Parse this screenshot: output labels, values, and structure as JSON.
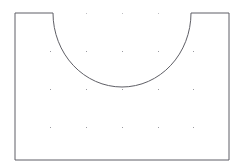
{
  "figure": {
    "background_color": "#ffffff",
    "outline_color": "#5f5f66",
    "outline_width": 1,
    "dot_color": "#8a8a90",
    "fill_color": "#ffffff"
  },
  "shape": {
    "name": "rectangle-with-semicircular-notch",
    "rect": {
      "left": 15,
      "top": 13,
      "right": 229,
      "bottom": 160,
      "width": 214,
      "height": 147
    },
    "notch": {
      "type": "semicircle",
      "center_x": 122,
      "center_y": 13,
      "radius": 69,
      "left_x": 53,
      "right_x": 191,
      "bottom_y": 87,
      "opens": "up"
    },
    "path": "M 15 13 L 53 13 A 69 74 0 0 0 191 13 L 229 13 L 229 160 L 15 160 Z"
  },
  "grid": {
    "columns_x": [
      50,
      86,
      122,
      158,
      193
    ],
    "rows_y": [
      13,
      51,
      89,
      127
    ],
    "visible_top_row_x": [
      86,
      122,
      158
    ],
    "dot_size": 1,
    "dots": [
      {
        "x": 86,
        "y": 13,
        "faint": true
      },
      {
        "x": 122,
        "y": 13,
        "faint": true
      },
      {
        "x": 158,
        "y": 13,
        "faint": true
      },
      {
        "x": 50,
        "y": 51,
        "faint": false
      },
      {
        "x": 86,
        "y": 51,
        "faint": false
      },
      {
        "x": 122,
        "y": 51,
        "faint": false
      },
      {
        "x": 158,
        "y": 51,
        "faint": false
      },
      {
        "x": 193,
        "y": 51,
        "faint": false
      },
      {
        "x": 50,
        "y": 89,
        "faint": false
      },
      {
        "x": 86,
        "y": 89,
        "faint": false
      },
      {
        "x": 122,
        "y": 89,
        "faint": false
      },
      {
        "x": 158,
        "y": 89,
        "faint": false
      },
      {
        "x": 193,
        "y": 89,
        "faint": false
      },
      {
        "x": 50,
        "y": 127,
        "faint": false
      },
      {
        "x": 86,
        "y": 127,
        "faint": false
      },
      {
        "x": 122,
        "y": 127,
        "faint": false
      },
      {
        "x": 158,
        "y": 127,
        "faint": false
      },
      {
        "x": 193,
        "y": 127,
        "faint": false
      }
    ]
  }
}
